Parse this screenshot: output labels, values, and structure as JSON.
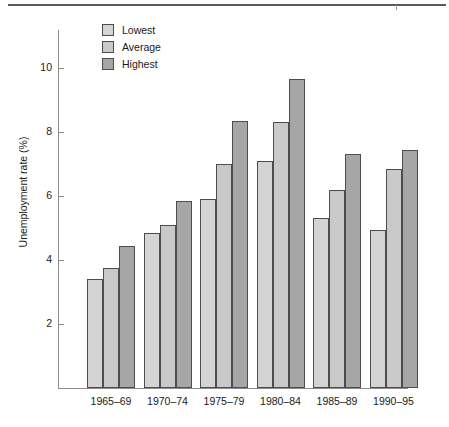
{
  "chart_data": {
    "type": "bar",
    "title": "",
    "xlabel": "",
    "ylabel": "Unemployment rate (%)",
    "categories": [
      "1965–69",
      "1970–74",
      "1975–79",
      "1980–84",
      "1985–89",
      "1990–95"
    ],
    "series": [
      {
        "name": "Lowest",
        "color": "#d4d4d4",
        "values": [
          3.4,
          4.85,
          5.9,
          7.1,
          5.3,
          4.95
        ]
      },
      {
        "name": "Average",
        "color": "#c9c9c9",
        "values": [
          3.75,
          5.1,
          7.0,
          8.3,
          6.2,
          6.85
        ]
      },
      {
        "name": "Highest",
        "color": "#a6a6a6",
        "values": [
          4.45,
          5.85,
          8.35,
          9.65,
          7.3,
          7.45
        ]
      }
    ],
    "ylim": [
      0,
      11.3
    ],
    "yticks": [
      2,
      4,
      6,
      8,
      10
    ],
    "ytick_labels": [
      "2",
      "4",
      "6",
      "8",
      "10"
    ],
    "grid": false,
    "legend_position": "top-left",
    "legend_entries": [
      "Lowest",
      "Average",
      "Highest"
    ]
  },
  "axis": {
    "y_title": "Unemployment rate (%)"
  }
}
